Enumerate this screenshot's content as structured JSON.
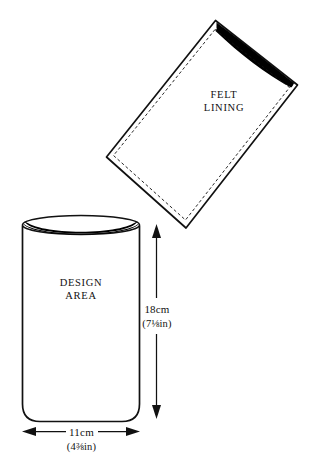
{
  "figure": {
    "background_color": "#ffffff",
    "ink_color": "#111111",
    "opening_color": "#000000"
  },
  "lining_piece": {
    "label_line1": "FELT",
    "label_line2": "LINING",
    "rotation_degrees": -34
  },
  "body_piece": {
    "label_line1": "DESIGN",
    "label_line2": "AREA"
  },
  "dimensions": {
    "height": {
      "metric": "18cm",
      "imperial": "(7⅛in)"
    },
    "width": {
      "metric": "11cm",
      "imperial": "(4⅜in)"
    }
  }
}
